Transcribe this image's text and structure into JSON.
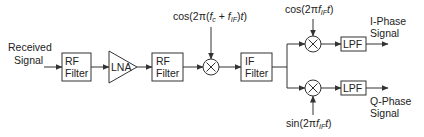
{
  "diagram": {
    "type": "superheterodyne receiver block diagram",
    "input": {
      "line1": "Received",
      "line2": "Signal"
    },
    "blocks": {
      "rf_filter_1": {
        "line1": "RF",
        "line2": "Filter"
      },
      "lna": {
        "label": "LNA"
      },
      "rf_filter_2": {
        "line1": "RF",
        "line2": "Filter"
      },
      "if_filter": {
        "line1": "IF",
        "line2": "Filter"
      },
      "lpf_i": {
        "label": "LPF"
      },
      "lpf_q": {
        "label": "LPF"
      }
    },
    "mixers": {
      "rf_mixer": {
        "symbol": "×"
      },
      "i_mixer": {
        "symbol": "×"
      },
      "q_mixer": {
        "symbol": "×"
      }
    },
    "local_oscillators": {
      "rf_lo": {
        "prefix": "cos(2π(",
        "f1": "f",
        "f1_sub": "c",
        "mid": " + ",
        "f2": "f",
        "f2_sub": "IF",
        "suffix": ")",
        "t": "t",
        "end": ")"
      },
      "i_lo": {
        "prefix": "cos(2π",
        "f": "f",
        "f_sub": "IF",
        "t": "t",
        "end": ")"
      },
      "q_lo": {
        "prefix": "sin(2π",
        "f": "f",
        "f_sub": "IF",
        "t": "t",
        "end": ")"
      }
    },
    "outputs": {
      "i": {
        "line1": "I-Phase",
        "line2": "Signal"
      },
      "q": {
        "line1": "Q-Phase",
        "line2": "Signal"
      }
    },
    "colors": {
      "stroke": "#333333",
      "background": "#ffffff",
      "text": "#222222"
    }
  }
}
